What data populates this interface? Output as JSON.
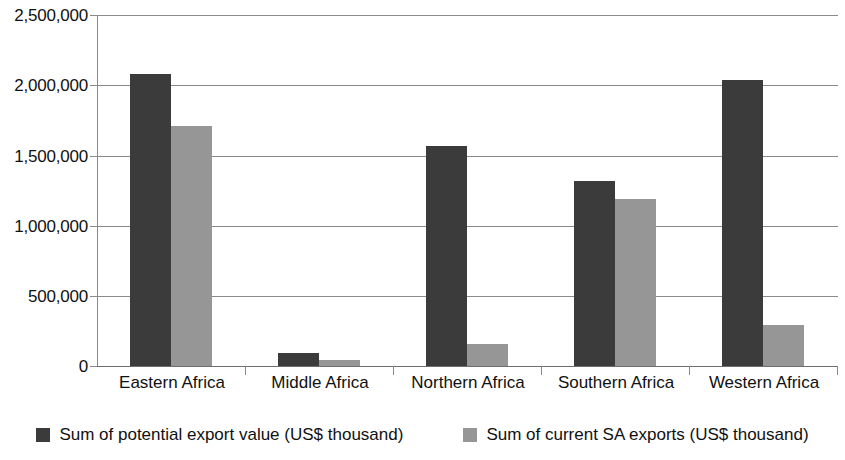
{
  "chart_data": {
    "type": "bar",
    "title": "",
    "subtitle": "",
    "xlabel": "",
    "ylabel": "",
    "categories": [
      "Eastern Africa",
      "Middle Africa",
      "Northern Africa",
      "Southern Africa",
      "Western Africa"
    ],
    "series": [
      {
        "name": "Sum of potential export value (US$ thousand)",
        "color": "#3b3b3b",
        "values": [
          2080000,
          95000,
          1570000,
          1320000,
          2040000
        ]
      },
      {
        "name": "Sum of current SA exports (US$ thousand)",
        "color": "#969696",
        "values": [
          1710000,
          45000,
          155000,
          1190000,
          295000
        ]
      }
    ],
    "ylim": [
      0,
      2500000
    ],
    "ytick_values": [
      0,
      500000,
      1000000,
      1500000,
      2000000,
      2500000
    ],
    "ytick_labels": [
      "0",
      "500,000",
      "1,000,000",
      "1,500,000",
      "2,000,000",
      "2,500,000"
    ],
    "grid": true,
    "grid_axis": "y",
    "legend_position": "bottom"
  },
  "legend": {
    "items": [
      {
        "label": "Sum of potential export value (US$ thousand)",
        "swatch": "legend-swatch-dark"
      },
      {
        "label": "Sum of current SA exports (US$ thousand)",
        "swatch": "legend-swatch-gray"
      }
    ]
  },
  "colors": {
    "series_potential": "#3b3b3b",
    "series_current": "#969696",
    "gridline": "#8a8a8a",
    "axis": "#8a8a8a",
    "text": "#111111",
    "background": "#ffffff"
  }
}
